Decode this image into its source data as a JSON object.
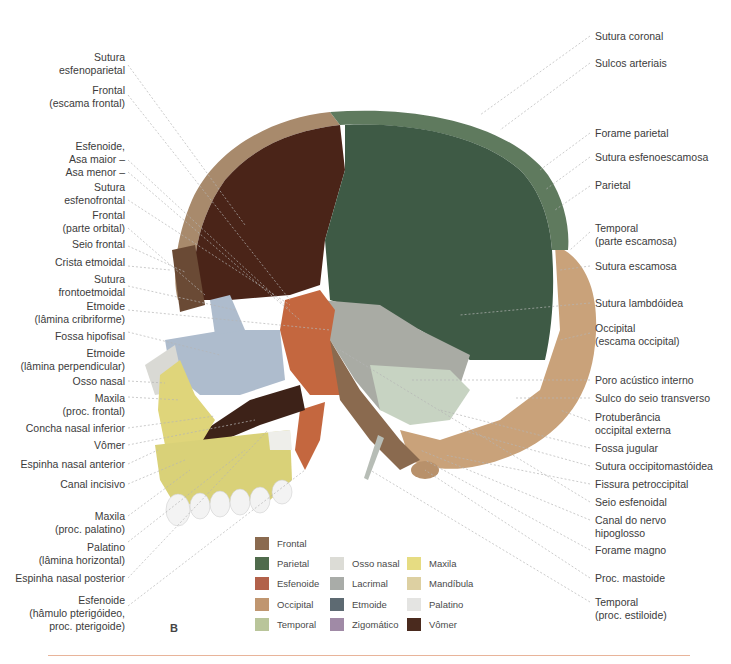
{
  "figure": {
    "panel_letter": "B",
    "rule_color": "#e8b49a"
  },
  "labels_left": [
    {
      "lines": [
        "Sutura",
        "esfenoparietal"
      ]
    },
    {
      "lines": [
        "Frontal",
        "(escama frontal)"
      ]
    },
    {
      "lines": [
        "Esfenoide,",
        "Asa maior –",
        "Asa menor –"
      ]
    },
    {
      "lines": [
        "Sutura",
        "esfenofrontal"
      ]
    },
    {
      "lines": [
        "Frontal",
        "(parte orbital)"
      ]
    },
    {
      "lines": [
        "Seio frontal"
      ]
    },
    {
      "lines": [
        "Crista etmoidal"
      ]
    },
    {
      "lines": [
        "Sutura",
        "frontoetmoidal"
      ]
    },
    {
      "lines": [
        "Etmoide",
        "(lâmina cribriforme)"
      ]
    },
    {
      "lines": [
        "Fossa hipofisal"
      ]
    },
    {
      "lines": [
        "Etmoide",
        "(lâmina perpendicular)"
      ]
    },
    {
      "lines": [
        "Osso nasal"
      ]
    },
    {
      "lines": [
        "Maxila",
        "(proc. frontal)"
      ]
    },
    {
      "lines": [
        "Concha nasal inferior"
      ]
    },
    {
      "lines": [
        "Vômer"
      ]
    },
    {
      "lines": [
        "Espinha nasal anterior"
      ]
    },
    {
      "lines": [
        "Canal incisivo"
      ]
    },
    {
      "lines": [
        "Maxila",
        "(proc. palatino)"
      ]
    },
    {
      "lines": [
        "Palatino",
        "(lâmina horizontal)"
      ]
    },
    {
      "lines": [
        "Espinha nasal posterior"
      ]
    },
    {
      "lines": [
        "Esfenoide",
        "(hâmulo pterigóideo,",
        "proc. pterigoide)"
      ]
    }
  ],
  "labels_right": [
    {
      "lines": [
        "Sutura coronal"
      ]
    },
    {
      "lines": [
        "Sulcos arteriais"
      ]
    },
    {
      "lines": [
        "Forame parietal"
      ]
    },
    {
      "lines": [
        "Sutura esfenoescamosa"
      ]
    },
    {
      "lines": [
        "Parietal"
      ]
    },
    {
      "lines": [
        "Temporal",
        "(parte escamosa)"
      ]
    },
    {
      "lines": [
        "Sutura escamosa"
      ]
    },
    {
      "lines": [
        "Sutura lambdóidea"
      ]
    },
    {
      "lines": [
        "Occipital",
        "(escama occipital)"
      ]
    },
    {
      "lines": [
        "Poro acústico interno"
      ]
    },
    {
      "lines": [
        "Sulco do seio transverso"
      ]
    },
    {
      "lines": [
        "Protuberância",
        "occipital externa"
      ]
    },
    {
      "lines": [
        "Fossa jugular"
      ]
    },
    {
      "lines": [
        "Sutura occipitomastóidea"
      ]
    },
    {
      "lines": [
        "Fissura petroccipital"
      ]
    },
    {
      "lines": [
        "Seio esfenoidal"
      ]
    },
    {
      "lines": [
        "Canal do nervo",
        "hipoglosso"
      ]
    },
    {
      "lines": [
        "Forame magno"
      ]
    },
    {
      "lines": [
        "Proc. mastoide"
      ]
    },
    {
      "lines": [
        "Temporal",
        "(proc. estiloide)"
      ]
    }
  ],
  "legend": [
    {
      "label": "Frontal",
      "color": "#8a6a4f"
    },
    {
      "label": "Parietal",
      "color": "#4f6b4c"
    },
    {
      "label": "Esfenoide",
      "color": "#b2614a"
    },
    {
      "label": "Occipital",
      "color": "#c09670"
    },
    {
      "label": "Temporal",
      "color": "#b9c59a"
    },
    {
      "label": "Osso nasal",
      "color": "#dcdcd6"
    },
    {
      "label": "Lacrimal",
      "color": "#a9aca8"
    },
    {
      "label": "Etmoide",
      "color": "#5d6a72"
    },
    {
      "label": "Zigomático",
      "color": "#a08aa6"
    },
    {
      "label": "Maxila",
      "color": "#e6dc82"
    },
    {
      "label": "Mandíbula",
      "color": "#ddd0a2"
    },
    {
      "label": "Palatino",
      "color": "#e4e4e2"
    },
    {
      "label": "Vômer",
      "color": "#4a2a1e"
    }
  ]
}
